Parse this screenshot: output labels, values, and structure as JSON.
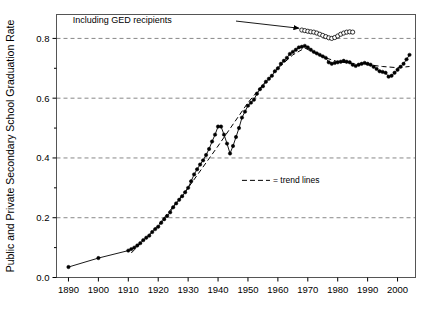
{
  "chart_data": {
    "type": "line",
    "title": "",
    "subtitle": "",
    "xlabel": "",
    "ylabel": "Public and Private Secondary School Graduation Rate",
    "xlim": [
      1886,
      2006
    ],
    "ylim": [
      0.0,
      0.88
    ],
    "grid": "horizontal-dashed",
    "x_ticks": [
      1890,
      1900,
      1910,
      1920,
      1930,
      1940,
      1950,
      1960,
      1970,
      1980,
      1990,
      2000
    ],
    "x_tick_labels": [
      "1890",
      "1900",
      "1910",
      "1920",
      "1930",
      "1940",
      "1950",
      "1960",
      "1970",
      "1980",
      "1990",
      "2000"
    ],
    "y_ticks": [
      0.0,
      0.2,
      0.4,
      0.6,
      0.8
    ],
    "y_tick_labels": [
      "0.0",
      "0.2",
      "0.4",
      "0.6",
      "0.8"
    ],
    "y_minor_ticks": [
      0.1,
      0.3,
      0.5,
      0.7
    ],
    "legend_position": "inside-center-right",
    "series": [
      {
        "name": "graduation-rate",
        "marker": "filled-circle",
        "line_style": "solid",
        "color": "#000000",
        "x": [
          1890,
          1900,
          1910,
          1911,
          1912,
          1913,
          1914,
          1915,
          1916,
          1917,
          1918,
          1919,
          1920,
          1921,
          1922,
          1923,
          1924,
          1925,
          1926,
          1927,
          1928,
          1929,
          1930,
          1931,
          1932,
          1933,
          1934,
          1935,
          1936,
          1937,
          1938,
          1939,
          1940,
          1941,
          1942,
          1943,
          1944,
          1945,
          1946,
          1947,
          1948,
          1949,
          1950,
          1951,
          1952,
          1953,
          1954,
          1955,
          1956,
          1957,
          1958,
          1959,
          1960,
          1961,
          1962,
          1963,
          1964,
          1965,
          1966,
          1967,
          1968,
          1969,
          1970,
          1971,
          1972,
          1973,
          1974,
          1975,
          1976,
          1977,
          1978,
          1979,
          1980,
          1981,
          1982,
          1983,
          1984,
          1985,
          1986,
          1987,
          1988,
          1989,
          1990,
          1991,
          1992,
          1993,
          1994,
          1995,
          1996,
          1997,
          1998,
          1999,
          2000,
          2001,
          2002,
          2003,
          2004
        ],
        "y": [
          0.035,
          0.065,
          0.09,
          0.095,
          0.1,
          0.107,
          0.115,
          0.125,
          0.133,
          0.14,
          0.152,
          0.162,
          0.17,
          0.183,
          0.195,
          0.206,
          0.218,
          0.235,
          0.248,
          0.26,
          0.272,
          0.285,
          0.3,
          0.322,
          0.345,
          0.362,
          0.378,
          0.392,
          0.41,
          0.43,
          0.455,
          0.478,
          0.505,
          0.505,
          0.478,
          0.448,
          0.415,
          0.44,
          0.47,
          0.5,
          0.535,
          0.555,
          0.575,
          0.585,
          0.595,
          0.615,
          0.63,
          0.64,
          0.655,
          0.665,
          0.675,
          0.69,
          0.7,
          0.715,
          0.725,
          0.735,
          0.748,
          0.755,
          0.762,
          0.77,
          0.772,
          0.775,
          0.77,
          0.762,
          0.755,
          0.75,
          0.745,
          0.74,
          0.735,
          0.72,
          0.715,
          0.718,
          0.72,
          0.722,
          0.725,
          0.722,
          0.72,
          0.712,
          0.708,
          0.712,
          0.715,
          0.718,
          0.715,
          0.712,
          0.705,
          0.698,
          0.69,
          0.688,
          0.685,
          0.672,
          0.675,
          0.685,
          0.695,
          0.705,
          0.715,
          0.73,
          0.745
        ]
      },
      {
        "name": "including-ged-recipients",
        "marker": "open-circle",
        "line_style": "solid",
        "color": "#000000",
        "x": [
          1968,
          1969,
          1970,
          1971,
          1972,
          1973,
          1974,
          1975,
          1976,
          1977,
          1978,
          1979,
          1980,
          1981,
          1982,
          1983,
          1984,
          1985
        ],
        "y": [
          0.828,
          0.826,
          0.824,
          0.822,
          0.821,
          0.818,
          0.814,
          0.81,
          0.806,
          0.802,
          0.8,
          0.803,
          0.808,
          0.814,
          0.818,
          0.821,
          0.822,
          0.821
        ]
      },
      {
        "name": "trend-line-early",
        "marker": "none",
        "line_style": "dashed",
        "color": "#000000",
        "x": [
          1911,
          1920,
          1930,
          1940,
          1950,
          1955
        ],
        "y": [
          0.082,
          0.175,
          0.3,
          0.44,
          0.585,
          0.645
        ]
      },
      {
        "name": "trend-line-late",
        "marker": "none",
        "line_style": "dashed",
        "color": "#000000",
        "x": [
          1955,
          1960,
          1965,
          1969,
          1975,
          1980,
          1985,
          1990,
          1995,
          2000,
          2004
        ],
        "y": [
          0.645,
          0.7,
          0.745,
          0.768,
          0.738,
          0.722,
          0.716,
          0.712,
          0.706,
          0.702,
          0.706
        ]
      }
    ],
    "annotations": [
      {
        "name": "including-ged-recipients-annotation",
        "text": "Including GED recipients",
        "text_x": 1908,
        "text_y": 0.862,
        "arrow_from_x": 1946,
        "arrow_from_y": 0.858,
        "arrow_to_x": 1967,
        "arrow_to_y": 0.834
      }
    ],
    "legend": {
      "entries": [
        {
          "name": "trend-lines-legend-entry",
          "label": "= trend lines",
          "line_style": "dashed",
          "color": "#000000"
        }
      ],
      "x": 1948,
      "y": 0.325
    },
    "colors": {
      "axis": "#000000",
      "gridline": "#888888",
      "data_line": "#000000",
      "background": "#ffffff",
      "frame": "#555555"
    }
  }
}
